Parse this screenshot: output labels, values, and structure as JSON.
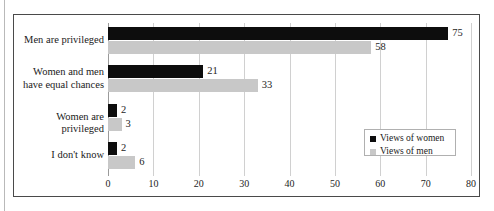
{
  "page": {
    "cutoff_text_fragments": [
      "i",
      "g",
      "u",
      "r",
      "e"
    ]
  },
  "chart_data": {
    "type": "bar",
    "orientation": "horizontal",
    "title": "",
    "xlabel": "",
    "ylabel": "",
    "xlim": [
      0,
      80
    ],
    "xticks": [
      0,
      10,
      20,
      30,
      40,
      50,
      60,
      70,
      80
    ],
    "grid": true,
    "legend_position": "lower-right",
    "categories": [
      "Men are privileged",
      "Women and men have equal chances",
      "Women are privileged",
      "I don't know"
    ],
    "category_lines": [
      [
        "Men are privileged"
      ],
      [
        "Women and men",
        "have equal chances"
      ],
      [
        "Women are privileged"
      ],
      [
        "I don't know"
      ]
    ],
    "series": [
      {
        "name": "Views of women",
        "color": "#0d0d0d",
        "values": [
          75,
          21,
          2,
          2
        ],
        "labels": [
          "75",
          "21",
          "2",
          "2"
        ]
      },
      {
        "name": "Views of men",
        "color": "#c8c8c8",
        "values": [
          58,
          33,
          3,
          6
        ],
        "labels": [
          "58",
          "33",
          "3",
          "6"
        ]
      }
    ]
  }
}
